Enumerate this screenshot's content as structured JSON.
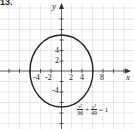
{
  "problem_number": "13.",
  "diagram": {
    "type": "ellipse-graph",
    "equation": {
      "term1_num": "x²",
      "term1_den": "36",
      "plus": "+",
      "term2_num": "y²",
      "term2_den": "49",
      "equals": "= 1"
    },
    "axes": {
      "x_label": "x",
      "y_label": "y",
      "x_ticks": [
        "-4",
        "-2",
        "2",
        "4",
        "8"
      ],
      "y_ticks": [
        "4",
        "2",
        "-2",
        "-4"
      ],
      "grid_step": 2
    },
    "ellipse": {
      "center": [
        0,
        0
      ],
      "semi_x": 6,
      "semi_y": 7
    },
    "colors": {
      "grid": "#d0d0d0",
      "axis": "#333333",
      "curve": "#222222"
    }
  }
}
